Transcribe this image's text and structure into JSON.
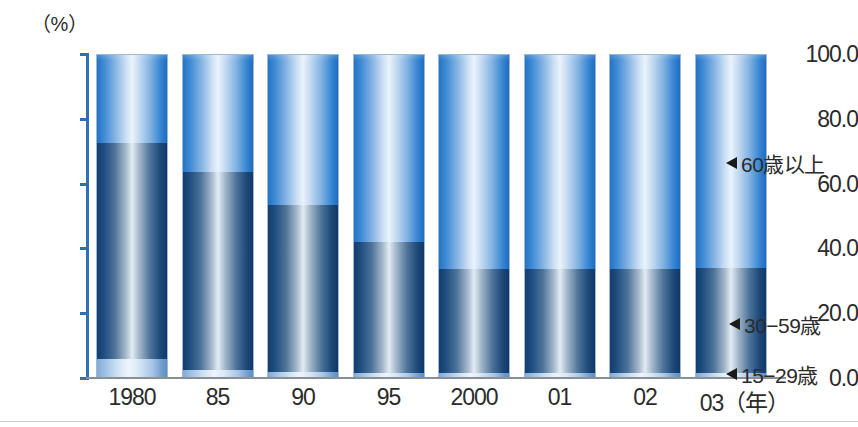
{
  "chart_data": {
    "type": "bar",
    "stacked": true,
    "title": "",
    "subtitle": "",
    "xlabel": "（年）",
    "ylabel": "（%）",
    "ylim": [
      0,
      100
    ],
    "yticks": [
      0.0,
      20.0,
      40.0,
      60.0,
      80.0,
      100.0
    ],
    "ytick_labels": [
      "0.0",
      "20.0",
      "40.0",
      "60.0",
      "80.0",
      "100.0"
    ],
    "grid": false,
    "legend_position": "right-callouts",
    "categories": [
      "1980",
      "85",
      "90",
      "95",
      "2000",
      "01",
      "02",
      "03"
    ],
    "series": [
      {
        "name": "15−29歳",
        "color": "#cfe2f3",
        "values": [
          6.0,
          2.5,
          2.0,
          1.5,
          1.5,
          1.5,
          1.5,
          1.5
        ]
      },
      {
        "name": "30−59歳",
        "color": "#1d4c7f",
        "values": [
          66.5,
          61.0,
          51.5,
          40.5,
          32.0,
          32.0,
          32.0,
          32.5
        ]
      },
      {
        "name": "60歳以上",
        "color": "#2f86d2",
        "values": [
          27.5,
          36.5,
          46.5,
          58.0,
          66.5,
          66.5,
          66.5,
          66.0
        ]
      }
    ],
    "cumulative_tops": {
      "15−29歳": [
        6.0,
        2.5,
        2.0,
        1.5,
        1.5,
        1.5,
        1.5,
        1.5
      ],
      "30−59歳": [
        72.5,
        63.5,
        53.5,
        42.0,
        33.5,
        33.5,
        33.5,
        34.0
      ],
      "60歳以上": [
        100.0,
        100.0,
        100.0,
        100.0,
        100.0,
        100.0,
        100.0,
        100.0
      ]
    }
  },
  "axis": {
    "unit_label": "（%）",
    "y_ticks": [
      {
        "label": "100.0",
        "value": 100
      },
      {
        "label": "80.0",
        "value": 80
      },
      {
        "label": "60.0",
        "value": 60
      },
      {
        "label": "40.0",
        "value": 40
      },
      {
        "label": "20.0",
        "value": 20
      },
      {
        "label": "0.0",
        "value": 0
      }
    ],
    "x_labels": [
      "1980",
      "85",
      "90",
      "95",
      "2000",
      "01",
      "02",
      "03（年）"
    ]
  },
  "legend": {
    "old": "60歳以上",
    "mid": "30−59歳",
    "young": "15−29歳"
  },
  "colors": {
    "axis_blue": "#2f6fb5",
    "series_old": "#2f86d2",
    "series_mid": "#1d4c7f",
    "series_young": "#cfe2f3",
    "text": "#2b2b2b"
  }
}
